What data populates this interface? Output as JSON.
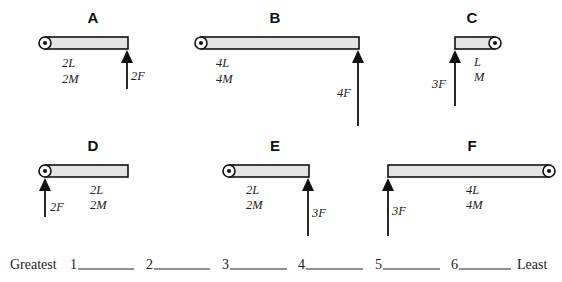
{
  "diagrams": [
    {
      "id": "A",
      "title": "A",
      "length": "2L",
      "mass": "2M",
      "force": "2F"
    },
    {
      "id": "B",
      "title": "B",
      "length": "4L",
      "mass": "4M",
      "force": "4F"
    },
    {
      "id": "C",
      "title": "C",
      "length": "L",
      "mass": "M",
      "force": "3F"
    },
    {
      "id": "D",
      "title": "D",
      "length": "2L",
      "mass": "2M",
      "force": "2F"
    },
    {
      "id": "E",
      "title": "E",
      "length": "2L",
      "mass": "2M",
      "force": "3F"
    },
    {
      "id": "F",
      "title": "F",
      "length": "4L",
      "mass": "4M",
      "force": "3F"
    }
  ],
  "ranking": {
    "greatest_label": "Greatest",
    "least_label": "Least",
    "slots": [
      {
        "number": "1",
        "value": ""
      },
      {
        "number": "2",
        "value": ""
      },
      {
        "number": "3",
        "value": ""
      },
      {
        "number": "4",
        "value": ""
      },
      {
        "number": "5",
        "value": ""
      },
      {
        "number": "6",
        "value": ""
      }
    ]
  }
}
